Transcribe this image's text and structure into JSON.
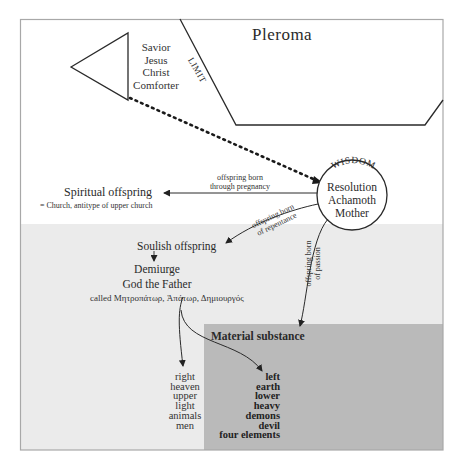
{
  "diagram": {
    "title_region": "Pleroma",
    "limit_label": "LIMIT",
    "savior": {
      "lines": [
        "Savior",
        "Jesus",
        "Christ",
        "Comforter"
      ]
    },
    "wisdom": {
      "arc_label": "WISDOM",
      "lines": [
        "Resolution",
        "Achamoth",
        "Mother"
      ]
    },
    "spiritual": {
      "title": "Spiritual offspring",
      "note": "= Church, antitype of upper church",
      "arrow_label_line1": "offspring born",
      "arrow_label_line2": "through pregnancy"
    },
    "soulish": {
      "title": "Soulish offspring",
      "arrow_label_line1": "offspring born",
      "arrow_label_line2": "of repentance",
      "demiurge": "Demiurge",
      "god_the_father": "God the Father",
      "called": "called Μητροπάτωρ, Ἀπάτωρ, Δημιουργός"
    },
    "passion": {
      "arrow_label_line1": "offspring born",
      "arrow_label_line2": "of passion"
    },
    "material": {
      "title": "Material substance",
      "left_list": [
        "left",
        "earth",
        "lower",
        "heavy",
        "demons",
        "devil",
        "four elements"
      ]
    },
    "right_list": [
      "right",
      "heaven",
      "upper",
      "light",
      "animals",
      "men"
    ],
    "colors": {
      "frame": "#a8a8a8",
      "soulish_region": "#ebebeb",
      "material_region": "#bababa",
      "line": "#2a2a2a"
    }
  }
}
